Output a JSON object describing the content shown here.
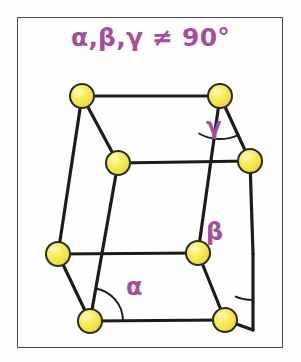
{
  "figure": {
    "kind": "triclinic-unit-cell-diagram",
    "title": "α,β,γ ≠ 90°",
    "frame": {
      "x": 17,
      "y": 17,
      "width": 266,
      "height": 331,
      "border_color": "#4a4a4a"
    },
    "background_color": "#fefefe",
    "accent_color": "#a44e9c",
    "edge_color": "#1c1c1c",
    "atom_fill_color": "#f5e84a",
    "atom_highlight_color": "#fbf7a8",
    "atom_stroke_color": "#2a2a2a",
    "atom_radius": 12,
    "angle_labels": [
      {
        "id": "alpha",
        "symbol": "α",
        "x": 126,
        "y": 275
      },
      {
        "id": "beta",
        "symbol": "β",
        "x": 206,
        "y": 220
      },
      {
        "id": "gamma",
        "symbol": "γ",
        "x": 206,
        "y": 115
      }
    ],
    "vertices": [
      {
        "id": "back-top-left",
        "label": "atom",
        "x": 82,
        "y": 96
      },
      {
        "id": "back-top-right",
        "label": "atom",
        "x": 220,
        "y": 96
      },
      {
        "id": "front-top-left",
        "label": "atom",
        "x": 118,
        "y": 163
      },
      {
        "id": "front-top-right",
        "label": "atom",
        "x": 250,
        "y": 161
      },
      {
        "id": "back-bottom-left",
        "label": "atom",
        "x": 58,
        "y": 254
      },
      {
        "id": "back-bottom-right",
        "label": "atom",
        "x": 198,
        "y": 253
      },
      {
        "id": "front-bottom-left",
        "label": "atom",
        "x": 90,
        "y": 321
      },
      {
        "id": "front-bottom-right",
        "label": "atom",
        "x": 225,
        "y": 320
      }
    ],
    "hidden_corners": [
      {
        "id": "right-rear-mid",
        "x": 253,
        "y": 254
      },
      {
        "id": "right-rear-bottom",
        "x": 253,
        "y": 330
      }
    ],
    "edges": [
      {
        "from": "back-top-left",
        "to": "back-top-right"
      },
      {
        "from": "back-top-left",
        "to": "front-top-left"
      },
      {
        "from": "back-top-right",
        "to": "front-top-right"
      },
      {
        "from": "front-top-left",
        "to": "front-top-right"
      },
      {
        "from": "back-top-left",
        "to": "back-bottom-left"
      },
      {
        "from": "back-top-right",
        "to": "back-bottom-right"
      },
      {
        "from": "front-top-left",
        "to": "front-bottom-left"
      },
      {
        "from": "front-top-right",
        "to": "right-rear-mid"
      },
      {
        "from": "back-bottom-left",
        "to": "back-bottom-right"
      },
      {
        "from": "back-bottom-left",
        "to": "front-bottom-left"
      },
      {
        "from": "back-bottom-right",
        "to": "front-bottom-right"
      },
      {
        "from": "front-bottom-left",
        "to": "front-bottom-right"
      },
      {
        "from": "right-rear-mid",
        "to": "right-rear-bottom"
      },
      {
        "from": "front-bottom-right",
        "to": "right-rear-bottom"
      }
    ],
    "angle_arcs": [
      {
        "id": "alpha-arc",
        "center": "front-bottom-left",
        "radius": 33
      },
      {
        "id": "beta-arc",
        "center": "right-rear-mid",
        "radius": 46
      },
      {
        "id": "gamma-arc",
        "center": "back-top-right",
        "radius": 43
      }
    ]
  }
}
